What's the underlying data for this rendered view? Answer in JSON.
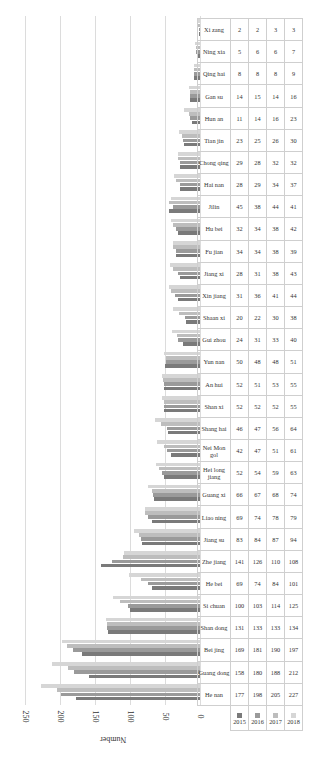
{
  "chart_data": {
    "type": "bar",
    "orientation": "horizontal",
    "title": "",
    "xlabel": "",
    "ylabel": "Number",
    "ylim": [
      0,
      250
    ],
    "ticks": [
      0,
      50,
      100,
      150,
      200,
      250
    ],
    "grid": true,
    "legend_position": "table",
    "categories": [
      "He nan",
      "Guang dong",
      "Bei jing",
      "Shan dong",
      "Si chuan",
      "He bei",
      "Zhe jiang",
      "Jiang su",
      "Liao ning",
      "Guang xi",
      "Hei long jiang",
      "Nei Mon gol",
      "Shang hai",
      "Shan xi",
      "An hui",
      "Yun nan",
      "Gui zhou",
      "Shaan xi",
      "Xin jiang",
      "Jiang xi",
      "Fu jian",
      "Hu bei",
      "Jilin",
      "Hai nan",
      "Chong qing",
      "Tian jin",
      "Hun an",
      "Gan su",
      "Qing hai",
      "Ning xia",
      "Xi zang"
    ],
    "series": [
      {
        "name": "2015",
        "color": "#7a7a7a",
        "values": [
          177,
          158,
          169,
          131,
          100,
          69,
          141,
          83,
          69,
          66,
          52,
          42,
          46,
          52,
          52,
          50,
          24,
          20,
          31,
          28,
          34,
          32,
          45,
          28,
          29,
          23,
          11,
          14,
          8,
          5,
          2
        ]
      },
      {
        "name": "2016",
        "color": "#9a9a9a",
        "values": [
          198,
          180,
          181,
          133,
          103,
          74,
          126,
          84,
          74,
          67,
          54,
          47,
          47,
          52,
          51,
          48,
          31,
          22,
          36,
          31,
          34,
          34,
          38,
          29,
          28,
          25,
          14,
          15,
          8,
          6,
          2
        ]
      },
      {
        "name": "2017",
        "color": "#bdbdbd",
        "values": [
          205,
          188,
          190,
          133,
          114,
          84,
          110,
          87,
          78,
          68,
          59,
          51,
          56,
          52,
          53,
          48,
          33,
          30,
          41,
          38,
          38,
          38,
          44,
          34,
          32,
          26,
          16,
          14,
          8,
          6,
          3
        ]
      },
      {
        "name": "2018",
        "color": "#d6d6d6",
        "values": [
          227,
          212,
          197,
          134,
          125,
          101,
          108,
          94,
          79,
          74,
          63,
          61,
          64,
          55,
          55,
          51,
          40,
          38,
          44,
          43,
          39,
          42,
          41,
          37,
          32,
          30,
          23,
          16,
          9,
          7,
          3
        ]
      }
    ]
  }
}
